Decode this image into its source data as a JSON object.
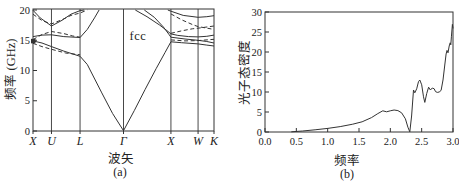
{
  "figure": {
    "background": "#ffffff",
    "ink_color": "#333333",
    "text_color": "#222222"
  },
  "chart_data": [
    {
      "type": "line",
      "id": "photonic-band-structure",
      "annotation": "fcc",
      "caption": "(a)",
      "xlabel": "波矢",
      "ylabel": "频率 (GHz)",
      "ylim": [
        0,
        20
      ],
      "yticks": [
        0,
        5,
        10,
        15,
        20
      ],
      "xtick_labels": [
        "X",
        "U",
        "L",
        "Γ",
        "X",
        "W",
        "K"
      ],
      "xtick_pos": [
        0,
        0.102,
        0.26,
        0.5,
        0.762,
        0.912,
        1
      ],
      "grid": "vertical-lines-at-kpoints",
      "legend": "none",
      "marker": {
        "kpoint_frac": 0,
        "ghz": 14.9,
        "shape": "filled-square"
      },
      "series": [
        {
          "name": "band-1-lowest",
          "style": "solid",
          "points": [
            [
              0,
              14.9
            ],
            [
              0.05,
              14.55
            ],
            [
              0.102,
              13.95
            ],
            [
              0.17,
              13.2
            ],
            [
              0.26,
              12.35
            ],
            [
              0.3,
              11.0
            ],
            [
              0.38,
              6.3
            ],
            [
              0.44,
              2.9
            ],
            [
              0.5,
              0.05
            ],
            [
              0.56,
              3.4
            ],
            [
              0.62,
              6.9
            ],
            [
              0.68,
              10.3
            ],
            [
              0.73,
              13.0
            ],
            [
              0.762,
              14.75
            ],
            [
              0.82,
              14.6
            ],
            [
              0.912,
              14.4
            ],
            [
              0.96,
              14.2
            ],
            [
              1,
              14.05
            ]
          ]
        },
        {
          "name": "band-2-XUL",
          "style": "solid",
          "points": [
            [
              0,
              15.6
            ],
            [
              0.05,
              15.85
            ],
            [
              0.102,
              15.9
            ],
            [
              0.17,
              15.6
            ],
            [
              0.26,
              15.45
            ],
            [
              0.3,
              16.8
            ],
            [
              0.34,
              18.7
            ],
            [
              0.365,
              20.0
            ]
          ]
        },
        {
          "name": "band-2-GXWK-upper",
          "style": "solid",
          "points": [
            [
              0.565,
              20.0
            ],
            [
              0.63,
              18.9
            ],
            [
              0.7,
              17.5
            ],
            [
              0.74,
              16.6
            ],
            [
              0.762,
              16.05
            ],
            [
              0.8,
              15.8
            ],
            [
              0.86,
              15.6
            ],
            [
              0.912,
              15.55
            ],
            [
              0.96,
              15.65
            ],
            [
              1,
              15.85
            ]
          ]
        },
        {
          "name": "band-2-GXWK-lower",
          "style": "solid",
          "points": [
            [
              0.615,
              20.0
            ],
            [
              0.67,
              18.8
            ],
            [
              0.72,
              17.2
            ],
            [
              0.75,
              16.0
            ],
            [
              0.762,
              15.5
            ],
            [
              0.84,
              15.2
            ],
            [
              0.912,
              15.0
            ],
            [
              0.96,
              14.8
            ],
            [
              1,
              14.55
            ]
          ]
        },
        {
          "name": "band-top-XUL",
          "style": "solid",
          "points": [
            [
              0,
              19.95
            ],
            [
              0.04,
              18.7
            ],
            [
              0.102,
              17.35
            ],
            [
              0.16,
              18.3
            ],
            [
              0.21,
              19.3
            ],
            [
              0.26,
              19.9
            ],
            [
              0.283,
              20.0
            ]
          ]
        },
        {
          "name": "band-top-XWK",
          "style": "solid",
          "points": [
            [
              0.745,
              20.0
            ],
            [
              0.762,
              19.8
            ],
            [
              0.83,
              19.1
            ],
            [
              0.912,
              18.8
            ],
            [
              0.96,
              18.9
            ],
            [
              1,
              19.05
            ]
          ]
        },
        {
          "name": "dashed-top-XUL",
          "style": "dashed",
          "points": [
            [
              0,
              19.3
            ],
            [
              0.05,
              18.25
            ],
            [
              0.102,
              17.7
            ],
            [
              0.16,
              18.4
            ],
            [
              0.21,
              19.1
            ],
            [
              0.26,
              19.5
            ],
            [
              0.3,
              20.0
            ]
          ]
        },
        {
          "name": "dashed-mid-XUL",
          "style": "dashed",
          "points": [
            [
              0,
              15.1
            ],
            [
              0.05,
              15.95
            ],
            [
              0.102,
              16.45
            ],
            [
              0.17,
              16.1
            ],
            [
              0.22,
              15.7
            ],
            [
              0.26,
              15.5
            ]
          ]
        },
        {
          "name": "dashed-low-XUL",
          "style": "dashed",
          "points": [
            [
              0,
              14.5
            ],
            [
              0.05,
              13.95
            ],
            [
              0.102,
              13.5
            ],
            [
              0.18,
              12.9
            ],
            [
              0.26,
              12.6
            ]
          ]
        },
        {
          "name": "dashed-down-XWK",
          "style": "dashed",
          "points": [
            [
              0.762,
              19.35
            ],
            [
              0.82,
              18.4
            ],
            [
              0.88,
              17.6
            ],
            [
              0.912,
              17.25
            ],
            [
              1,
              16.8
            ]
          ]
        },
        {
          "name": "dashed-up-XWK",
          "style": "dashed",
          "points": [
            [
              0.762,
              16.15
            ],
            [
              0.82,
              16.55
            ],
            [
              0.88,
              16.9
            ],
            [
              0.912,
              17.0
            ],
            [
              1,
              17.35
            ]
          ]
        },
        {
          "name": "dashed-low-XWK",
          "style": "dashed",
          "points": [
            [
              0.762,
              15.05
            ],
            [
              0.84,
              14.9
            ],
            [
              0.912,
              14.95
            ],
            [
              1,
              15.15
            ]
          ]
        }
      ]
    },
    {
      "type": "line",
      "id": "photon-density-of-states",
      "caption": "(b)",
      "xlabel": "频率",
      "ylabel": "光子态密度",
      "xlim": [
        0,
        3
      ],
      "ylim": [
        0,
        30
      ],
      "xtick_labels": [
        "0.0",
        "0.5",
        "1.0",
        "1.5",
        "2.0",
        "2.5",
        "3.0"
      ],
      "xticks": [
        0,
        0.5,
        1,
        1.5,
        2,
        2.5,
        3
      ],
      "yticks": [
        0,
        5,
        10,
        15,
        20,
        25,
        30
      ],
      "grid": "off",
      "legend": "none",
      "box": true,
      "series": [
        {
          "name": "dos-curve",
          "style": "solid",
          "points": [
            [
              0.42,
              0.05
            ],
            [
              0.6,
              0.25
            ],
            [
              0.8,
              0.55
            ],
            [
              1.0,
              0.9
            ],
            [
              1.2,
              1.35
            ],
            [
              1.4,
              1.95
            ],
            [
              1.55,
              2.55
            ],
            [
              1.7,
              3.6
            ],
            [
              1.8,
              4.6
            ],
            [
              1.88,
              5.3
            ],
            [
              1.94,
              5.05
            ],
            [
              2.0,
              5.3
            ],
            [
              2.06,
              5.5
            ],
            [
              2.12,
              5.35
            ],
            [
              2.18,
              4.8
            ],
            [
              2.24,
              3.3
            ],
            [
              2.28,
              1.2
            ],
            [
              2.31,
              0.05
            ],
            [
              2.34,
              4.0
            ],
            [
              2.37,
              10.5
            ],
            [
              2.39,
              9.8
            ],
            [
              2.42,
              10.8
            ],
            [
              2.45,
              12.6
            ],
            [
              2.47,
              13.0
            ],
            [
              2.5,
              11.8
            ],
            [
              2.53,
              8.8
            ],
            [
              2.55,
              7.4
            ],
            [
              2.58,
              9.6
            ],
            [
              2.61,
              11.2
            ],
            [
              2.64,
              10.5
            ],
            [
              2.67,
              11.0
            ],
            [
              2.7,
              10.8
            ],
            [
              2.72,
              10.1
            ],
            [
              2.75,
              9.9
            ],
            [
              2.78,
              10.0
            ],
            [
              2.81,
              10.4
            ],
            [
              2.84,
              13.0
            ],
            [
              2.87,
              17.0
            ],
            [
              2.89,
              19.5
            ],
            [
              2.905,
              20.4
            ],
            [
              2.92,
              19.8
            ],
            [
              2.94,
              21.5
            ],
            [
              2.955,
              22.3
            ],
            [
              2.965,
              21.8
            ],
            [
              2.975,
              23.8
            ],
            [
              2.99,
              26.9
            ],
            [
              3.0,
              25.9
            ]
          ]
        }
      ]
    }
  ]
}
